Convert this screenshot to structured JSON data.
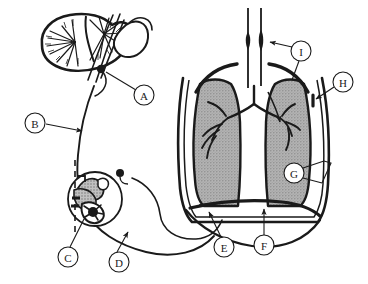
{
  "figure": {
    "background_color": "#ffffff",
    "line_color": "#1a1a1a",
    "lung_fill_color": "#a8a8a8",
    "width": 368,
    "height": 284
  },
  "callouts": [
    {
      "id": "A",
      "label": "A",
      "cx": 144,
      "cy": 95,
      "r": 10,
      "leader": "M 134 92 L 105 72"
    },
    {
      "id": "B",
      "label": "B",
      "cx": 35,
      "cy": 123,
      "r": 10,
      "leader": "M 45 124 L 84 130"
    },
    {
      "id": "C",
      "label": "C",
      "cx": 68,
      "cy": 257,
      "r": 10,
      "leader": "M 70 247 L 82 221"
    },
    {
      "id": "D",
      "label": "D",
      "cx": 119,
      "cy": 262,
      "r": 10,
      "leader": "M 117 252 L 127 233"
    },
    {
      "id": "E",
      "label": "E",
      "cx": 224,
      "cy": 247,
      "r": 10,
      "leader": "M 221 237 L 208 214"
    },
    {
      "id": "F",
      "label": "F",
      "cx": 264,
      "cy": 245,
      "r": 10,
      "leader": "M 264 235 L 264 211"
    },
    {
      "id": "G",
      "label": "G",
      "cx": 294,
      "cy": 173,
      "r": 10,
      "leader": "M 304 169 L 322 163"
    },
    {
      "id": "H",
      "label": "H",
      "cx": 343,
      "cy": 82,
      "r": 10,
      "leader": "M 334 88 L 312 99"
    },
    {
      "id": "I",
      "label": "I",
      "cx": 301,
      "cy": 51,
      "r": 10,
      "leader": "M 291 49 L 268 43"
    }
  ],
  "structures": {
    "brain": "cerebellum-brainstem",
    "nerve": "phrenic-vagus-nerve-pathway",
    "inset": "receptor-detail-circle",
    "trachea": "trachea",
    "bronchial_tree": "bronchial-tree",
    "lungs": "lungs-shaded",
    "pleura": "pleural-membrane",
    "diaphragm": "diaphragm",
    "chest_wall": "thoracic-wall"
  }
}
